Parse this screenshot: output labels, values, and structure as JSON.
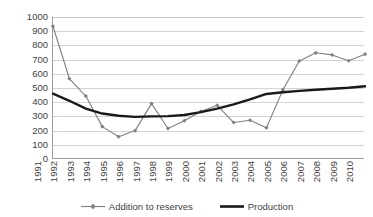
{
  "chart_data": {
    "type": "line",
    "title": "",
    "xlabel": "",
    "ylabel": "",
    "ylim": [
      0,
      1000
    ],
    "ytick_step": 100,
    "grid": true,
    "legend_position": "bottom",
    "categories": [
      "1991",
      "1992",
      "1993",
      "1994",
      "1995",
      "1996",
      "1997",
      "1998",
      "1999",
      "2000",
      "2001",
      "2002",
      "2003",
      "2004",
      "2005",
      "2006",
      "2007",
      "2008",
      "2009",
      "2010"
    ],
    "yticks": [
      "0",
      "100",
      "200",
      "300",
      "400",
      "500",
      "600",
      "700",
      "800",
      "900",
      "1000"
    ],
    "series": [
      {
        "name": "Addition to reserves",
        "color": "#808080",
        "marker": "diamond",
        "values": [
          935,
          565,
          443,
          228,
          157,
          200,
          390,
          215,
          270,
          335,
          378,
          257,
          273,
          220,
          487,
          690,
          748,
          733,
          692,
          738
        ]
      },
      {
        "name": "Production",
        "color": "#1a1a1a",
        "marker": "none",
        "values": [
          460,
          410,
          355,
          320,
          305,
          297,
          300,
          302,
          310,
          330,
          355,
          385,
          420,
          458,
          470,
          480,
          488,
          495,
          502,
          512
        ]
      }
    ]
  },
  "legend": {
    "items": [
      {
        "label": "Addition to reserves",
        "icon": "line-with-diamond-marker-icon"
      },
      {
        "label": "Production",
        "icon": "thick-line-icon"
      }
    ]
  }
}
